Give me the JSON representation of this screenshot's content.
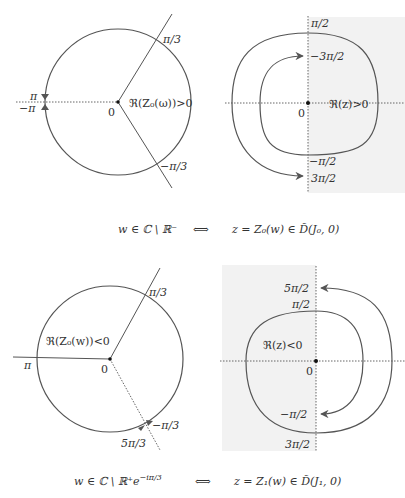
{
  "colors": {
    "curve": "#555555",
    "axis": "#555555",
    "shade": "#f2f2f2",
    "text": "#333333"
  },
  "panels": [
    {
      "id": "top-left",
      "plane": "w",
      "labels": {
        "pi_over_3": "π/3",
        "minus_pi_over_3": "−π/3",
        "pi": "π",
        "minus_pi": "−π",
        "origin": "0",
        "region": "ℜ(Z₀(ω))>0"
      }
    },
    {
      "id": "top-right",
      "plane": "z",
      "labels": {
        "pi_over_2": "π/2",
        "minus_3pi_over_2": "−3π/2",
        "minus_pi_over_2": "−π/2",
        "three_pi_over_2": "3π/2",
        "origin": "0",
        "region": "ℜ(z)>0"
      }
    },
    {
      "id": "bottom-left",
      "plane": "w",
      "labels": {
        "pi_over_3": "π/3",
        "minus_pi_over_3": "−π/3",
        "five_pi_over_3": "5π/3",
        "pi": "π",
        "origin": "0",
        "region": "ℜ(Z₀(w))<0"
      }
    },
    {
      "id": "bottom-right",
      "plane": "z",
      "labels": {
        "five_pi_over_2": "5π/2",
        "pi_over_2": "π/2",
        "minus_pi_over_2": "−π/2",
        "three_pi_over_2": "3π/2",
        "origin": "0",
        "region": "ℜ(z)<0"
      }
    }
  ],
  "captions": {
    "top": {
      "left": "w ∈ ℂ \\ ℝ⁻",
      "arrow": "⟺",
      "right": "z = Z₀(w) ∈ D̃(J₀, 0)"
    },
    "bottom": {
      "left": "w ∈ ℂ \\ ℝ⁺e^(−iπ/3)",
      "left_main": "w ∈ ℂ \\ ℝ⁺e",
      "left_sup": "−iπ/3",
      "arrow": "⟺",
      "right": "z = Z₁(w) ∈ D̃(J₁, 0)"
    }
  }
}
